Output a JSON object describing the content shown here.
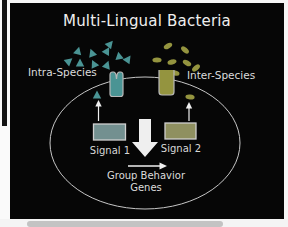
{
  "title": "Multi-Lingual Bacteria",
  "labels": {
    "intra": "Intra-Species",
    "inter": "Inter-Species",
    "signal1": "Signal 1",
    "signal2": "Signal 2",
    "genes_line1": "Group Behavior",
    "genes_line2": "Genes"
  },
  "colors": {
    "intra_teal": "#4a9494",
    "inter_olive": "#94943f",
    "signal1_box": "#739090",
    "signal2_box": "#8f9060",
    "outline": "#c6c6c6",
    "arrow": "#efefef"
  },
  "molecules": {
    "intra_triangles": [
      {
        "x": 78,
        "y": 51,
        "rot": 15
      },
      {
        "x": 92,
        "y": 53,
        "rot": -20
      },
      {
        "x": 107,
        "y": 51,
        "rot": 30
      },
      {
        "x": 110,
        "y": 44,
        "rot": 40
      },
      {
        "x": 69,
        "y": 61,
        "rot": 50
      },
      {
        "x": 80,
        "y": 63,
        "rot": 0
      },
      {
        "x": 94,
        "y": 64,
        "rot": -25
      },
      {
        "x": 107,
        "y": 65,
        "rot": 20
      },
      {
        "x": 119,
        "y": 56,
        "rot": -10
      },
      {
        "x": 128,
        "y": 59,
        "rot": 35
      },
      {
        "x": 97,
        "y": 95,
        "rot": 0
      }
    ],
    "inter_ellipses": [
      {
        "x": 168,
        "y": 46,
        "rot": -30
      },
      {
        "x": 185,
        "y": 50,
        "rot": 40
      },
      {
        "x": 157,
        "y": 60,
        "rot": 0
      },
      {
        "x": 172,
        "y": 62,
        "rot": -15
      },
      {
        "x": 187,
        "y": 63,
        "rot": 30
      },
      {
        "x": 196,
        "y": 68,
        "rot": -40
      },
      {
        "x": 175,
        "y": 73,
        "rot": 15
      },
      {
        "x": 190,
        "y": 97,
        "rot": 5
      }
    ]
  }
}
